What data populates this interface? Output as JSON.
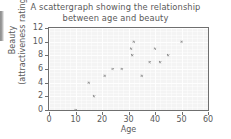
{
  "chart_data": {
    "type": "scatter",
    "title": "A scattergraph showing the relationship between age and beauty",
    "title_line1": "A scattergraph showing the relationship",
    "title_line2": "between age and beauty",
    "xlabel": "Age",
    "ylabel": "Beauty (attractiveness rating)",
    "ylabel_line1": "Beauty",
    "ylabel_line2": "(attractiveness rating)",
    "xlim": [
      0,
      60
    ],
    "ylim": [
      0,
      12
    ],
    "xticks": [
      0,
      10,
      20,
      30,
      40,
      50,
      60
    ],
    "yticks": [
      0,
      2,
      4,
      6,
      8,
      10,
      12
    ],
    "grid": true,
    "legend": null,
    "marker": "x",
    "marker_color": "#8c8c8c",
    "plot_background": "#f4f4f4",
    "axis_color": "#6f6f6f",
    "text_color": "#5a5a5a",
    "points": [
      {
        "x": 10,
        "y": 0
      },
      {
        "x": 15,
        "y": 4
      },
      {
        "x": 17,
        "y": 2
      },
      {
        "x": 21,
        "y": 5
      },
      {
        "x": 24,
        "y": 6
      },
      {
        "x": 27.5,
        "y": 6
      },
      {
        "x": 31,
        "y": 9
      },
      {
        "x": 31.5,
        "y": 8
      },
      {
        "x": 32,
        "y": 10
      },
      {
        "x": 35,
        "y": 5
      },
      {
        "x": 38,
        "y": 7
      },
      {
        "x": 40,
        "y": 9
      },
      {
        "x": 42,
        "y": 7
      },
      {
        "x": 45,
        "y": 8
      },
      {
        "x": 50,
        "y": 10
      }
    ]
  }
}
